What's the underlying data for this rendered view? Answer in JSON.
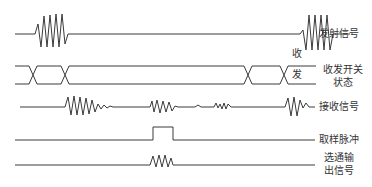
{
  "diagram": {
    "type": "timing-diagram",
    "signals": [
      {
        "id": "transmit",
        "label": "发射信号"
      },
      {
        "id": "switch",
        "label_line1": "收发开关",
        "label_line2": "状态",
        "state_top": "收",
        "state_bottom": "发"
      },
      {
        "id": "receive",
        "label": "接收信号"
      },
      {
        "id": "sample",
        "label": "取样脉冲"
      },
      {
        "id": "gated",
        "label_line1": "选通输",
        "label_line2": "出信号"
      }
    ],
    "colors": {
      "line": "#3a3a3a",
      "text": "#333333",
      "background": "#ffffff"
    }
  }
}
